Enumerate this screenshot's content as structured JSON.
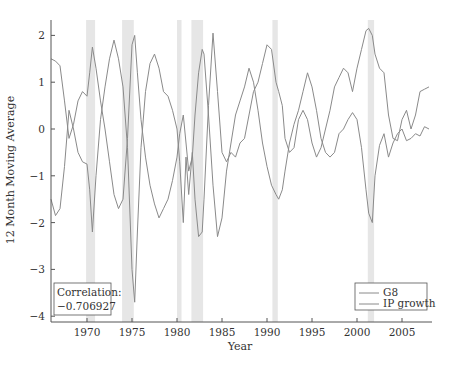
{
  "chart_data": {
    "type": "line",
    "title": "",
    "xlabel": "Year",
    "ylabel": "12 Month Moving Average",
    "xlim": [
      1966,
      2008
    ],
    "ylim": [
      -4.1,
      2.35
    ],
    "xticks": [
      1970,
      1975,
      1980,
      1985,
      1990,
      1995,
      2000,
      2005
    ],
    "yticks": [
      -4,
      -3,
      -2,
      -1,
      0,
      1,
      2
    ],
    "grid": false,
    "legend_position": "lower right",
    "annotation": {
      "line1": "Correlation:",
      "line2": "−0.706927"
    },
    "shaded_regions": [
      [
        1969.9,
        1970.9
      ],
      [
        1973.9,
        1975.2
      ],
      [
        1980.0,
        1980.5
      ],
      [
        1981.6,
        1982.9
      ],
      [
        1990.6,
        1991.2
      ],
      [
        2001.2,
        2001.9
      ]
    ],
    "series": [
      {
        "name": "G8",
        "color": "#8a8a8a",
        "x": [
          1966,
          1966.5,
          1967,
          1967.5,
          1968,
          1968.5,
          1969,
          1969.5,
          1970,
          1970.3,
          1970.6,
          1971,
          1971.5,
          1972,
          1972.5,
          1973,
          1973.5,
          1974,
          1974.5,
          1975,
          1975.3,
          1975.6,
          1976,
          1976.5,
          1977,
          1977.5,
          1978,
          1978.5,
          1979,
          1979.5,
          1980,
          1980.3,
          1980.7,
          1981,
          1981.3,
          1981.7,
          1982,
          1982.4,
          1982.8,
          1983,
          1983.5,
          1984,
          1984.5,
          1985,
          1985.5,
          1986,
          1986.5,
          1987,
          1987.5,
          1988,
          1988.5,
          1989,
          1989.5,
          1990,
          1990.5,
          1991,
          1991.3,
          1991.7,
          1992,
          1992.5,
          1993,
          1993.5,
          1994,
          1994.5,
          1995,
          1995.5,
          1996,
          1996.5,
          1997,
          1997.5,
          1998,
          1998.5,
          1999,
          1999.5,
          2000,
          2000.5,
          2001,
          2001.3,
          2001.7,
          2002,
          2002.5,
          2003,
          2003.5,
          2004,
          2004.5,
          2005,
          2005.5,
          2006,
          2006.5,
          2007,
          2007.5,
          2008
        ],
        "values": [
          1.5,
          1.45,
          1.35,
          0.6,
          -0.2,
          0.1,
          0.6,
          0.8,
          0.7,
          1.2,
          1.75,
          1.3,
          0.6,
          0.0,
          -0.7,
          -1.4,
          -1.7,
          -1.5,
          -0.2,
          1.8,
          2.0,
          1.2,
          0.2,
          -0.6,
          -1.2,
          -1.6,
          -1.9,
          -1.7,
          -1.5,
          -1.1,
          -0.6,
          -0.1,
          0.3,
          -0.3,
          -0.9,
          -0.6,
          0.3,
          1.2,
          1.7,
          1.6,
          0.3,
          -1.2,
          -2.3,
          -1.9,
          -0.9,
          -0.3,
          0.3,
          0.6,
          0.9,
          1.3,
          1.0,
          0.4,
          -0.3,
          -0.8,
          -1.2,
          -1.4,
          -1.5,
          -1.3,
          -0.9,
          -0.3,
          0.1,
          0.4,
          0.8,
          1.2,
          0.9,
          0.4,
          -0.2,
          -0.5,
          -0.6,
          -0.5,
          -0.1,
          0.0,
          0.2,
          0.35,
          0.2,
          -0.4,
          -1.3,
          -1.8,
          -2.0,
          -1.0,
          -0.35,
          -0.1,
          -0.6,
          -0.3,
          -0.1,
          0.0,
          -0.25,
          -0.2,
          -0.1,
          -0.15,
          0.05,
          0.0
        ]
      },
      {
        "name": "IP growth",
        "color": "#8a8a8a",
        "x": [
          1966,
          1966.5,
          1967,
          1967.5,
          1968,
          1968.5,
          1969,
          1969.5,
          1970,
          1970.3,
          1970.6,
          1971,
          1971.5,
          1972,
          1972.5,
          1973,
          1973.5,
          1974,
          1974.5,
          1975,
          1975.3,
          1975.6,
          1976,
          1976.5,
          1977,
          1977.5,
          1978,
          1978.5,
          1979,
          1979.5,
          1980,
          1980.3,
          1980.7,
          1981,
          1981.3,
          1981.7,
          1982,
          1982.4,
          1982.8,
          1983,
          1983.5,
          1984,
          1984.5,
          1985,
          1985.5,
          1986,
          1986.5,
          1987,
          1987.5,
          1988,
          1988.5,
          1989,
          1989.5,
          1990,
          1990.5,
          1991,
          1991.3,
          1991.7,
          1992,
          1992.5,
          1993,
          1993.5,
          1994,
          1994.5,
          1995,
          1995.5,
          1996,
          1996.5,
          1997,
          1997.5,
          1998,
          1998.5,
          1999,
          1999.5,
          2000,
          2000.5,
          2001,
          2001.3,
          2001.7,
          2002,
          2002.5,
          2003,
          2003.5,
          2004,
          2004.5,
          2005,
          2005.5,
          2006,
          2006.5,
          2007,
          2007.5,
          2008
        ],
        "values": [
          -1.5,
          -1.85,
          -1.7,
          -0.8,
          0.4,
          0.0,
          -0.5,
          -0.7,
          -0.75,
          -1.3,
          -2.2,
          -1.0,
          0.2,
          0.9,
          1.5,
          1.9,
          1.5,
          0.9,
          -0.4,
          -3.0,
          -3.7,
          -2.2,
          -0.4,
          0.8,
          1.4,
          1.6,
          1.3,
          0.8,
          0.7,
          0.4,
          0.0,
          -0.7,
          -2.0,
          -0.6,
          -1.4,
          -0.5,
          -1.5,
          -2.3,
          -2.2,
          -1.5,
          0.5,
          2.05,
          0.8,
          -0.5,
          -0.7,
          -0.5,
          -0.6,
          -0.3,
          -0.2,
          0.3,
          0.8,
          1.0,
          1.4,
          1.8,
          1.7,
          1.0,
          0.8,
          0.5,
          -0.2,
          -0.5,
          -0.4,
          0.2,
          0.4,
          0.2,
          -0.3,
          -0.6,
          -0.4,
          0.0,
          0.4,
          0.9,
          1.1,
          1.3,
          1.2,
          0.8,
          1.3,
          1.7,
          2.1,
          2.15,
          2.0,
          1.6,
          1.3,
          1.2,
          0.3,
          -0.2,
          -0.25,
          0.2,
          0.4,
          0.0,
          0.3,
          0.8,
          0.85,
          0.9
        ]
      }
    ]
  },
  "legend": {
    "items": [
      "G8",
      "IP growth"
    ]
  },
  "annotation": {
    "line1": "Correlation:",
    "line2": "−0.706927"
  },
  "axes": {
    "xlabel": "Year",
    "ylabel": "12 Month Moving Average"
  }
}
